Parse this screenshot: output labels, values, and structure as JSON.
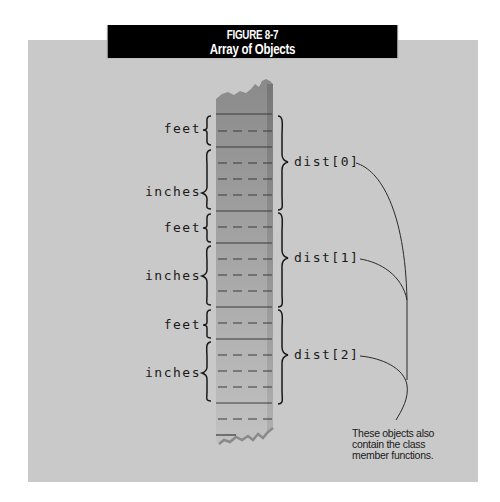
{
  "figure": {
    "number": "FIGURE 8-7",
    "title": "Array of Objects"
  },
  "memory_fields": [
    {
      "label": "feet",
      "y": 121
    },
    {
      "label": "inches",
      "y": 184
    },
    {
      "label": "feet",
      "y": 220
    },
    {
      "label": "inches",
      "y": 268
    },
    {
      "label": "feet",
      "y": 317
    },
    {
      "label": "inches",
      "y": 365
    }
  ],
  "objects": [
    {
      "label": "dist[0]"
    },
    {
      "label": "dist[1]"
    },
    {
      "label": "dist[2]"
    }
  ],
  "callout": {
    "line1": "These objects also",
    "line2": "contain the class",
    "line3": "member functions."
  },
  "colors": {
    "panel": "#c9c9c9",
    "title_bg": "#000000",
    "column_top": "#8e8e8e",
    "column_bottom": "#bdbdbd",
    "ink": "#1a1a1a"
  }
}
